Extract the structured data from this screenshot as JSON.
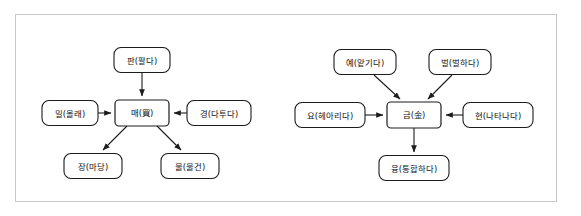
{
  "figure": {
    "kind": "two-panel-word-network-diagram",
    "panels": [
      {
        "id": "left-panel",
        "center": {
          "id": "mae",
          "head": "매",
          "gloss": "(買)",
          "label": "매(買)",
          "x": 142,
          "y": 113,
          "w": 54,
          "h": 26
        },
        "nodes": [
          {
            "id": "pan",
            "head": "판",
            "gloss": "(팔다)",
            "label": "판(팔다)",
            "x": 142,
            "y": 60,
            "w": 56,
            "h": 25,
            "position": "top"
          },
          {
            "id": "mil",
            "head": "밀",
            "gloss": "(몰래)",
            "label": "밀(몰래)",
            "x": 70,
            "y": 113,
            "w": 56,
            "h": 25,
            "position": "left"
          },
          {
            "id": "gyeong",
            "head": "경",
            "gloss": "(다투다)",
            "label": "경(다투다)",
            "x": 219,
            "y": 113,
            "w": 64,
            "h": 25,
            "position": "right"
          },
          {
            "id": "jang",
            "head": "장",
            "gloss": "(마당)",
            "label": "장(마당)",
            "x": 93,
            "y": 166,
            "w": 58,
            "h": 25,
            "position": "bottom-left"
          },
          {
            "id": "mul",
            "head": "물",
            "gloss": "(물건)",
            "label": "물(물건)",
            "x": 190,
            "y": 166,
            "w": 58,
            "h": 25,
            "position": "bottom-right"
          }
        ],
        "edges": [
          {
            "from": "pan",
            "to": "mae",
            "direction": "to-center"
          },
          {
            "from": "mil",
            "to": "mae",
            "direction": "to-center"
          },
          {
            "from": "gyeong",
            "to": "mae",
            "direction": "to-center"
          },
          {
            "from": "mae",
            "to": "jang",
            "direction": "from-center"
          },
          {
            "from": "mae",
            "to": "mul",
            "direction": "from-center"
          }
        ]
      },
      {
        "id": "right-panel",
        "center": {
          "id": "geum",
          "head": "금",
          "gloss": "(金)",
          "label": "금(金)",
          "x": 414,
          "y": 115,
          "w": 54,
          "h": 26
        },
        "nodes": [
          {
            "id": "ye",
            "head": "예",
            "gloss": "(맡기다)",
            "label": "예(맡기다)",
            "x": 365,
            "y": 62,
            "w": 62,
            "h": 25,
            "position": "top-left"
          },
          {
            "id": "beol",
            "head": "벌",
            "gloss": "(벌하다)",
            "label": "벌(벌하다)",
            "x": 460,
            "y": 62,
            "w": 62,
            "h": 25,
            "position": "top-right"
          },
          {
            "id": "yo",
            "head": "요",
            "gloss": "(헤아리다)",
            "label": "요(헤아리다)",
            "x": 330,
            "y": 115,
            "w": 70,
            "h": 25,
            "position": "left"
          },
          {
            "id": "hyeon",
            "head": "현",
            "gloss": "(나타나다)",
            "label": "현(나타나다)",
            "x": 498,
            "y": 115,
            "w": 70,
            "h": 25,
            "position": "right"
          },
          {
            "id": "yung",
            "head": "융",
            "gloss": "(통합하다)",
            "label": "융(통합하다)",
            "x": 414,
            "y": 168,
            "w": 70,
            "h": 25,
            "position": "bottom"
          }
        ],
        "edges": [
          {
            "from": "ye",
            "to": "geum",
            "direction": "to-center"
          },
          {
            "from": "beol",
            "to": "geum",
            "direction": "to-center"
          },
          {
            "from": "yo",
            "to": "geum",
            "direction": "to-center"
          },
          {
            "from": "hyeon",
            "to": "geum",
            "direction": "to-center"
          },
          {
            "from": "geum",
            "to": "yung",
            "direction": "from-center"
          }
        ]
      }
    ],
    "colors": {
      "frame_border": "#c9c9c9",
      "node_stroke": "#1c1c1c",
      "node_fill": "#ffffff",
      "edge_stroke": "#1c1c1c",
      "text": "#111111",
      "background": "#ffffff"
    }
  }
}
